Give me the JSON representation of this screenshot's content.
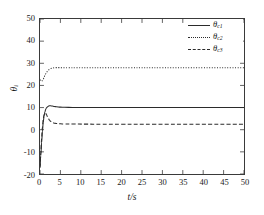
{
  "chart_data": {
    "type": "line",
    "title": "",
    "xlabel": "t/s",
    "ylabel": "θi",
    "xlim": [
      0,
      50
    ],
    "ylim": [
      -20,
      50
    ],
    "grid": false,
    "legend_position": "top-right",
    "xticks": [
      "0",
      "5",
      "10",
      "15",
      "20",
      "25",
      "30",
      "35",
      "40",
      "45",
      "50"
    ],
    "yticks": [
      "50",
      "40",
      "30",
      "20",
      "10",
      "0",
      "-10",
      "-20"
    ],
    "series": [
      {
        "name": "θc1",
        "label_base": "θ",
        "label_sub": "c1",
        "style": "solid",
        "color": "#2b2b2b",
        "steady_value": 10,
        "x": [
          0,
          0.2,
          0.4,
          0.6,
          0.8,
          1.0,
          1.2,
          1.4,
          1.6,
          1.8,
          2.0,
          2.3,
          2.6,
          3.0,
          3.5,
          4.0,
          5.0,
          6.0,
          8.0,
          10.0,
          12.0,
          14.0,
          18.0,
          24.0,
          32.0,
          40.0,
          50.0
        ],
        "y": [
          -17.0,
          -11.5,
          -5.8,
          -0.6,
          3.4,
          6.2,
          8.0,
          9.2,
          9.9,
          10.3,
          10.6,
          10.8,
          10.8,
          10.7,
          10.5,
          10.35,
          10.2,
          10.12,
          10.05,
          10.02,
          10.01,
          10.0,
          10.0,
          10.0,
          10.0,
          10.0,
          10.0
        ]
      },
      {
        "name": "θc2",
        "label_base": "θ",
        "label_sub": "c2",
        "style": "dotted",
        "color": "#2b2b2b",
        "steady_value": 28,
        "x": [
          0,
          0.2,
          0.4,
          0.6,
          0.8,
          1.0,
          1.3,
          1.6,
          2.0,
          2.4,
          2.8,
          3.2,
          3.6,
          4.0,
          4.6,
          5.2,
          6.0,
          7.0,
          9.0,
          12.0,
          16.0,
          22.0,
          30.0,
          40.0,
          50.0
        ],
        "y": [
          22.6,
          22.1,
          21.9,
          22.2,
          22.9,
          23.8,
          25.0,
          26.0,
          26.9,
          27.4,
          27.7,
          27.9,
          28.0,
          28.05,
          28.05,
          28.0,
          28.0,
          28.0,
          28.0,
          28.0,
          28.0,
          28.0,
          28.0,
          28.0,
          28.0
        ]
      },
      {
        "name": "θc3",
        "label_base": "θ",
        "label_sub": "c3",
        "style": "dashed",
        "color": "#2b2b2b",
        "steady_value": 2.5,
        "x": [
          0,
          0.2,
          0.4,
          0.6,
          0.8,
          1.0,
          1.2,
          1.4,
          1.6,
          1.8,
          2.0,
          2.3,
          2.6,
          3.0,
          3.5,
          4.0,
          5.0,
          6.0,
          8.0,
          11.0,
          15.0,
          20.0,
          28.0,
          38.0,
          50.0
        ],
        "y": [
          -17.0,
          -10.5,
          -4.0,
          1.2,
          4.8,
          6.9,
          7.6,
          7.4,
          6.8,
          6.0,
          5.3,
          4.4,
          3.8,
          3.3,
          2.95,
          2.8,
          2.65,
          2.6,
          2.55,
          2.52,
          2.5,
          2.5,
          2.5,
          2.5,
          2.5
        ]
      }
    ]
  }
}
